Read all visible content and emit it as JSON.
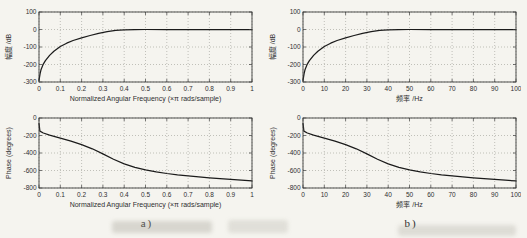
{
  "page": {
    "background": "#f5f4ef",
    "captions": {
      "left": "a)",
      "right": "b)"
    }
  },
  "colors": {
    "curve": "#1b1b1b",
    "grid": "#a9a9a2",
    "box": "#3d3d3d",
    "text": "#2f2f2f"
  },
  "chart_data": [
    {
      "id": "magnitude-normalized",
      "type": "line",
      "title": "",
      "xlabel": "Normalized Angular Frequency  (×π rads/sample)",
      "ylabel": "幅度 /dB",
      "xlim": [
        0,
        1
      ],
      "ylim": [
        -300,
        100
      ],
      "xticks": [
        0,
        0.1,
        0.2,
        0.3,
        0.4,
        0.5,
        0.6,
        0.7,
        0.8,
        0.9,
        1
      ],
      "yticks": [
        -300,
        -200,
        -100,
        0,
        100
      ],
      "grid": true,
      "legend": null,
      "x": [
        0,
        0.005,
        0.01,
        0.02,
        0.03,
        0.05,
        0.07,
        0.1,
        0.13,
        0.16,
        0.2,
        0.24,
        0.28,
        0.32,
        0.36,
        0.4,
        0.45,
        0.5,
        0.6,
        0.7,
        0.8,
        0.9,
        1
      ],
      "y": [
        -290,
        -252,
        -228,
        -198,
        -178,
        -148,
        -124,
        -97,
        -78,
        -63,
        -48,
        -34,
        -22,
        -12,
        -5,
        -1.5,
        -0.3,
        0,
        0,
        0,
        0,
        0,
        0
      ]
    },
    {
      "id": "phase-normalized",
      "type": "line",
      "title": "",
      "xlabel": "Normalized Angular Frequency  (×π rads/sample)",
      "ylabel": "Phase (degrees)",
      "xlim": [
        0,
        1
      ],
      "ylim": [
        -800,
        0
      ],
      "xticks": [
        0,
        0.1,
        0.2,
        0.3,
        0.4,
        0.5,
        0.6,
        0.7,
        0.8,
        0.9,
        1
      ],
      "yticks": [
        -800,
        -600,
        -400,
        -200,
        0
      ],
      "grid": true,
      "legend": null,
      "x": [
        0,
        0.004,
        0.02,
        0.05,
        0.1,
        0.15,
        0.2,
        0.25,
        0.3,
        0.35,
        0.4,
        0.45,
        0.5,
        0.55,
        0.6,
        0.65,
        0.7,
        0.75,
        0.8,
        0.85,
        0.9,
        0.95,
        1
      ],
      "y": [
        -60,
        -150,
        -172,
        -195,
        -230,
        -265,
        -305,
        -352,
        -410,
        -472,
        -525,
        -565,
        -592,
        -615,
        -634,
        -649,
        -661,
        -673,
        -684,
        -694,
        -702,
        -711,
        -719
      ]
    },
    {
      "id": "magnitude-hz",
      "type": "line",
      "title": "",
      "xlabel": "频率 /Hz",
      "ylabel": "幅度 /dB",
      "xlim": [
        0,
        100
      ],
      "ylim": [
        -300,
        100
      ],
      "xticks": [
        0,
        10,
        20,
        30,
        40,
        50,
        60,
        70,
        80,
        90,
        100
      ],
      "yticks": [
        -300,
        -200,
        -100,
        0,
        100
      ],
      "grid": true,
      "legend": null,
      "x": [
        0,
        0.5,
        1,
        2,
        3,
        5,
        7,
        10,
        13,
        16,
        20,
        24,
        28,
        32,
        36,
        40,
        45,
        50,
        60,
        70,
        80,
        90,
        100
      ],
      "y": [
        -290,
        -252,
        -228,
        -198,
        -178,
        -148,
        -124,
        -97,
        -78,
        -63,
        -48,
        -34,
        -22,
        -12,
        -5,
        -1.5,
        -0.3,
        0,
        0,
        0,
        0,
        0,
        0
      ]
    },
    {
      "id": "phase-hz",
      "type": "line",
      "title": "",
      "xlabel": "频率 /Hz",
      "ylabel": "Phase (degrees)",
      "xlim": [
        0,
        100
      ],
      "ylim": [
        -800,
        0
      ],
      "xticks": [
        0,
        10,
        20,
        30,
        40,
        50,
        60,
        70,
        80,
        90,
        100
      ],
      "yticks": [
        -800,
        -600,
        -400,
        -200,
        0
      ],
      "grid": true,
      "legend": null,
      "x": [
        0,
        0.4,
        2,
        5,
        10,
        15,
        20,
        25,
        30,
        35,
        40,
        45,
        50,
        55,
        60,
        65,
        70,
        75,
        80,
        85,
        90,
        95,
        100
      ],
      "y": [
        -60,
        -150,
        -172,
        -195,
        -230,
        -265,
        -305,
        -352,
        -410,
        -472,
        -525,
        -565,
        -592,
        -615,
        -634,
        -649,
        -661,
        -673,
        -684,
        -694,
        -702,
        -711,
        -719
      ]
    }
  ]
}
